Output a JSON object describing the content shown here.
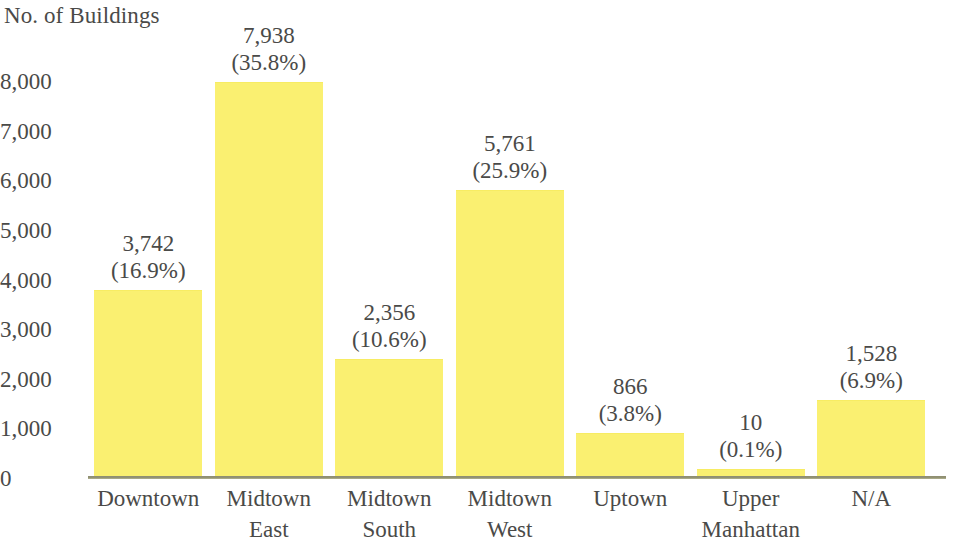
{
  "chart_data": {
    "type": "bar",
    "title": "",
    "ylabel": "No. of Buildings",
    "xlabel": "",
    "ylim": [
      0,
      8000
    ],
    "ytick_labels": [
      "8,000",
      "7,000",
      "6,000",
      "5,000",
      "4,000",
      "3,000",
      "2,000",
      "1,000",
      "0"
    ],
    "ytick_values": [
      8000,
      7000,
      6000,
      5000,
      4000,
      3000,
      2000,
      1000,
      0
    ],
    "grid": false,
    "legend": false,
    "bar_color": "#FAF071",
    "text_color": "#4A4A48",
    "axis_color": "#8F8F72",
    "categories": [
      "Downtown",
      "Midtown East",
      "Midtown South",
      "Midtown West",
      "Uptown",
      "Upper Manhattan",
      "N/A"
    ],
    "category_lines": [
      [
        "Downtown"
      ],
      [
        "Midtown",
        "East"
      ],
      [
        "Midtown",
        "South"
      ],
      [
        "Midtown",
        "West"
      ],
      [
        "Uptown"
      ],
      [
        "Upper",
        "Manhattan"
      ],
      [
        "N/A"
      ]
    ],
    "values": [
      3742,
      7938,
      2356,
      5761,
      866,
      10,
      1528
    ],
    "percents": [
      16.9,
      35.8,
      10.6,
      25.9,
      3.8,
      0.1,
      6.9
    ],
    "value_labels": [
      "3,742",
      "7,938",
      "2,356",
      "5,761",
      "866",
      "10",
      "1,528"
    ],
    "percent_labels": [
      "(16.9%)",
      "(35.8%)",
      "(10.6%)",
      "(25.9%)",
      "(3.8%)",
      "(0.1%)",
      "(6.9%)"
    ]
  }
}
